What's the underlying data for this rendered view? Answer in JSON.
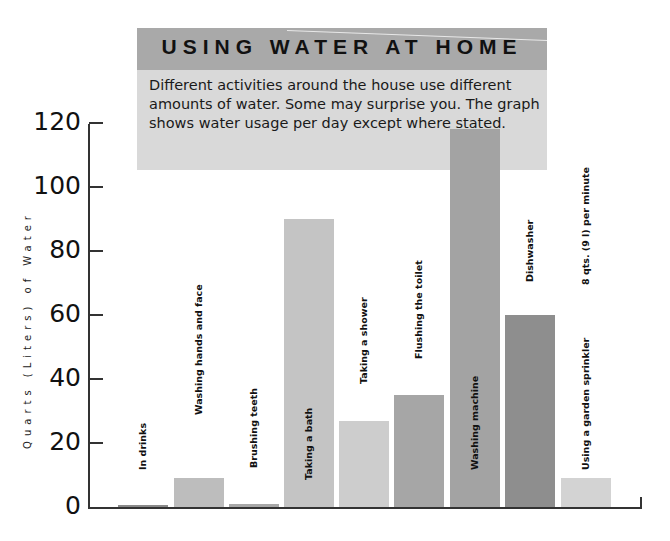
{
  "header": {
    "title": "USING WATER AT HOME",
    "description": "Different activities around the house use different amounts of water. Some may surprise you. The graph shows water usage per day except where stated."
  },
  "colors": {
    "banner": "#a9a9a9",
    "infobox": "#d9d9d9",
    "axis": "#333333"
  },
  "chart_data": {
    "type": "bar",
    "title": "USING WATER AT HOME",
    "subtitle": "Different activities around the house use different amounts of water. Some may surprise you. The graph shows water usage per day except where stated.",
    "xlabel": "",
    "ylabel": "Quarts (Liters) of Water",
    "ylim": [
      0,
      120
    ],
    "yticks": [
      0,
      20,
      40,
      60,
      80,
      100,
      120
    ],
    "grid": false,
    "legend": "none",
    "categories": [
      "In drinks",
      "Washing hands and face",
      "Brushing teeth",
      "Taking a bath",
      "Taking a shower",
      "Flushing the toilet",
      "Washing machine",
      "Dishwasher",
      "Using a garden sprinkler"
    ],
    "values": [
      0.5,
      9,
      1,
      90,
      27,
      35,
      118,
      60,
      9
    ],
    "bar_colors": [
      "#8a8a8a",
      "#bdbdbd",
      "#a8a8a8",
      "#c4c4c4",
      "#cdcdcd",
      "#a6a6a6",
      "#a3a3a3",
      "#8e8e8e",
      "#d3d3d3"
    ],
    "annotations": [
      "8 qts. (9 l) per minute"
    ]
  },
  "axis": {
    "y_title": "Quarts (Liters) of Water",
    "ticks": [
      "0",
      "20",
      "40",
      "60",
      "80",
      "100",
      "120"
    ]
  },
  "bars": [
    {
      "label": "In drinks",
      "value": 0.5
    },
    {
      "label": "Washing hands and face",
      "value": 9
    },
    {
      "label": "Brushing teeth",
      "value": 1
    },
    {
      "label": "Taking a bath",
      "value": 90
    },
    {
      "label": "Taking a shower",
      "value": 27
    },
    {
      "label": "Flushing the toilet",
      "value": 35
    },
    {
      "label": "Washing machine",
      "value": 118
    },
    {
      "label": "Dishwasher",
      "value": 60
    },
    {
      "label": "Using a garden sprinkler",
      "value": 9,
      "note": "8 qts. (9 l) per minute"
    }
  ]
}
